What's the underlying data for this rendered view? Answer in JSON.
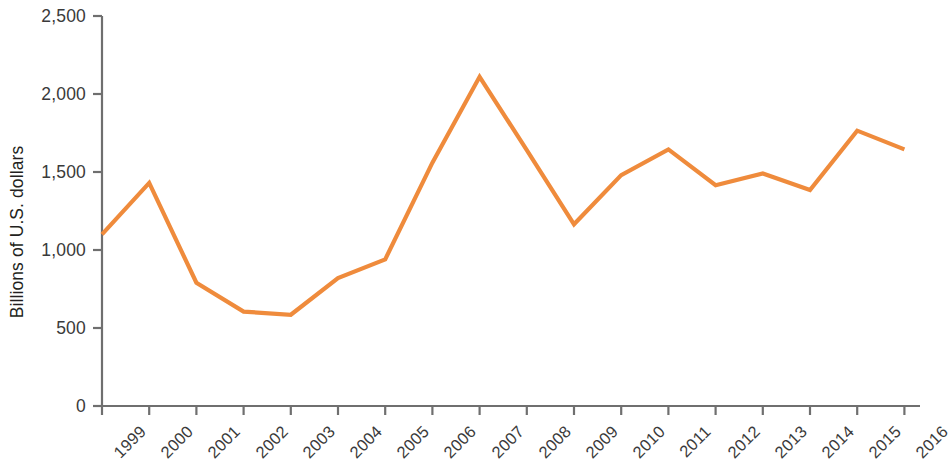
{
  "chart_data": {
    "type": "line",
    "title": "",
    "xlabel": "",
    "ylabel": "Billions of U.S. dollars",
    "categories": [
      "1999",
      "2000",
      "2001",
      "2002",
      "2003",
      "2004",
      "2005",
      "2006",
      "2007",
      "2008",
      "2009",
      "2010",
      "2011",
      "2012",
      "2013",
      "2014",
      "2015",
      "2016"
    ],
    "values": [
      1100,
      1430,
      790,
      605,
      585,
      820,
      940,
      1560,
      2110,
      1640,
      1165,
      1480,
      1645,
      1415,
      1490,
      1385,
      1765,
      1645
    ],
    "series": [
      {
        "name": "Billions of U.S. dollars",
        "color": "#ef8b3c",
        "values": [
          1100,
          1430,
          790,
          605,
          585,
          820,
          940,
          1560,
          2110,
          1640,
          1165,
          1480,
          1645,
          1415,
          1490,
          1385,
          1765,
          1645
        ]
      }
    ],
    "ylim": [
      0,
      2500
    ],
    "y_ticks": [
      0,
      500,
      1000,
      1500,
      2000,
      2500
    ],
    "y_tick_labels": [
      "0",
      "500",
      "1,000",
      "1,500",
      "2,000",
      "2,500"
    ],
    "x_tick_labels": [
      "1999",
      "2000",
      "2001",
      "2002",
      "2003",
      "2004",
      "2005",
      "2006",
      "2007",
      "2008",
      "2009",
      "2010",
      "2011",
      "2012",
      "2013",
      "2014",
      "2015",
      "2016"
    ],
    "grid": false,
    "legend": "none",
    "line_color": "#ef8b3c",
    "axis_color": "#6f6f6f",
    "text_color": "#3a3a3a"
  },
  "axis": {
    "y_title": "Billions of U.S. dollars"
  }
}
